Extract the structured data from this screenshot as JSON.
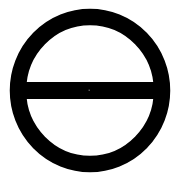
{
  "symbol": {
    "name": "circle-with-horizontal-bar",
    "description": "Thick black ring with a horizontal bar across its diameter",
    "colors": {
      "background": "#ffffff",
      "stroke": "#000000",
      "center_dot": "#555555"
    }
  }
}
